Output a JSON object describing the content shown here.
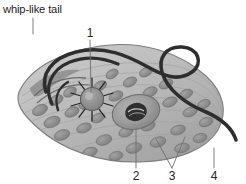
{
  "figure": {
    "title_caption": "whip-like tail",
    "background_color": "#ffffff",
    "labels": {
      "text_label": "whip-like tail",
      "numbers": [
        {
          "id": "1",
          "text": "1",
          "x": 90,
          "y": 33,
          "points_to": "contractile-vacuole-stigma"
        },
        {
          "id": "2",
          "text": "2",
          "x": 136,
          "y": 177,
          "points_to": "nucleus"
        },
        {
          "id": "3",
          "text": "3",
          "x": 172,
          "y": 177,
          "points_to": "chloroplasts"
        },
        {
          "id": "4",
          "text": "4",
          "x": 214,
          "y": 177,
          "points_to": "pellicle-membrane"
        }
      ]
    },
    "colors": {
      "flagellum": "#2e2e2e",
      "cell_body_fill": "#b7b7b7",
      "cell_body_outline": "#7d7d7d",
      "chloroplast": "#8e8e8e",
      "nucleus": "#9a9a9a",
      "nucleolus": "#2b2b2b",
      "leader_line": "#6f6f6f",
      "text": "#1d1d1d"
    },
    "structures": [
      {
        "name": "flagellum",
        "common_name": "whip-like tail"
      },
      {
        "name": "contractile-vacuole",
        "common_name": "contractile vacuole"
      },
      {
        "name": "nucleus",
        "common_name": "nucleus"
      },
      {
        "name": "chloroplasts",
        "common_name": "chloroplasts"
      },
      {
        "name": "pellicle",
        "common_name": "pellicle"
      }
    ]
  }
}
